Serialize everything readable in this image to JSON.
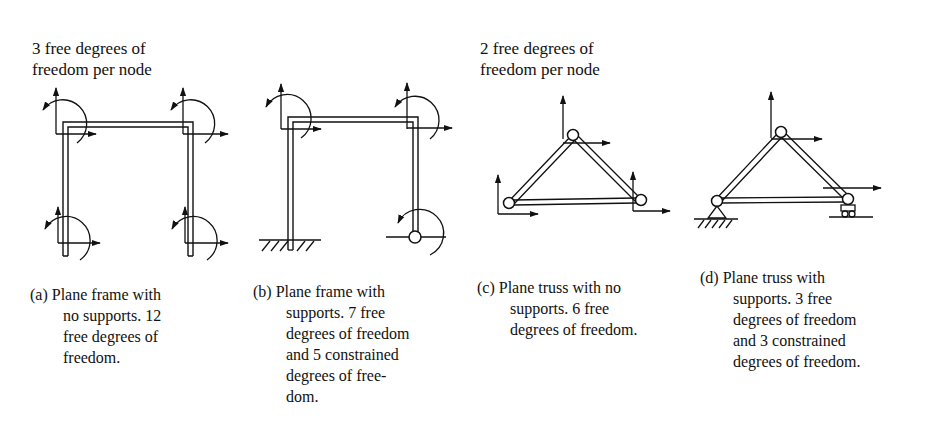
{
  "headings": {
    "frames": [
      "3 free degrees of",
      "freedom per node"
    ],
    "trusses": [
      "2 free degrees of",
      "freedom per node"
    ]
  },
  "panels": [
    {
      "id": "a",
      "label": "(a)",
      "type": "plane-frame",
      "supports": "none",
      "free_dof": 12,
      "constrained_dof": 0,
      "caption_lines": [
        "(a) Plane frame with",
        "no supports.  12",
        "free degrees of",
        "freedom."
      ]
    },
    {
      "id": "b",
      "label": "(b)",
      "type": "plane-frame",
      "supports": "fixed-left, pinned-right",
      "free_dof": 7,
      "constrained_dof": 5,
      "caption_lines": [
        "(b) Plane frame with",
        "supports. 7 free",
        "degrees of freedom",
        "and 5 constrained",
        "degrees of free-",
        "dom."
      ]
    },
    {
      "id": "c",
      "label": "(c)",
      "type": "plane-truss",
      "supports": "none",
      "free_dof": 6,
      "constrained_dof": 0,
      "caption_lines": [
        "(c) Plane truss with no",
        "supports. 6 free",
        "degrees of freedom."
      ]
    },
    {
      "id": "d",
      "label": "(d)",
      "type": "plane-truss",
      "supports": "pinned-left, roller-right",
      "free_dof": 3,
      "constrained_dof": 3,
      "caption_lines": [
        "(d) Plane truss with",
        "supports. 3 free",
        "degrees of freedom",
        "and 3 constrained",
        "degrees of freedom."
      ]
    }
  ],
  "icons": {
    "translation": "arrow-icon",
    "rotation": "curved-arrow-icon",
    "fixed_support": "hatched-ground-icon",
    "pin": "hinge-circle-icon",
    "roller": "roller-support-icon"
  },
  "colors": {
    "ink": "#111111",
    "background": "#ffffff"
  }
}
